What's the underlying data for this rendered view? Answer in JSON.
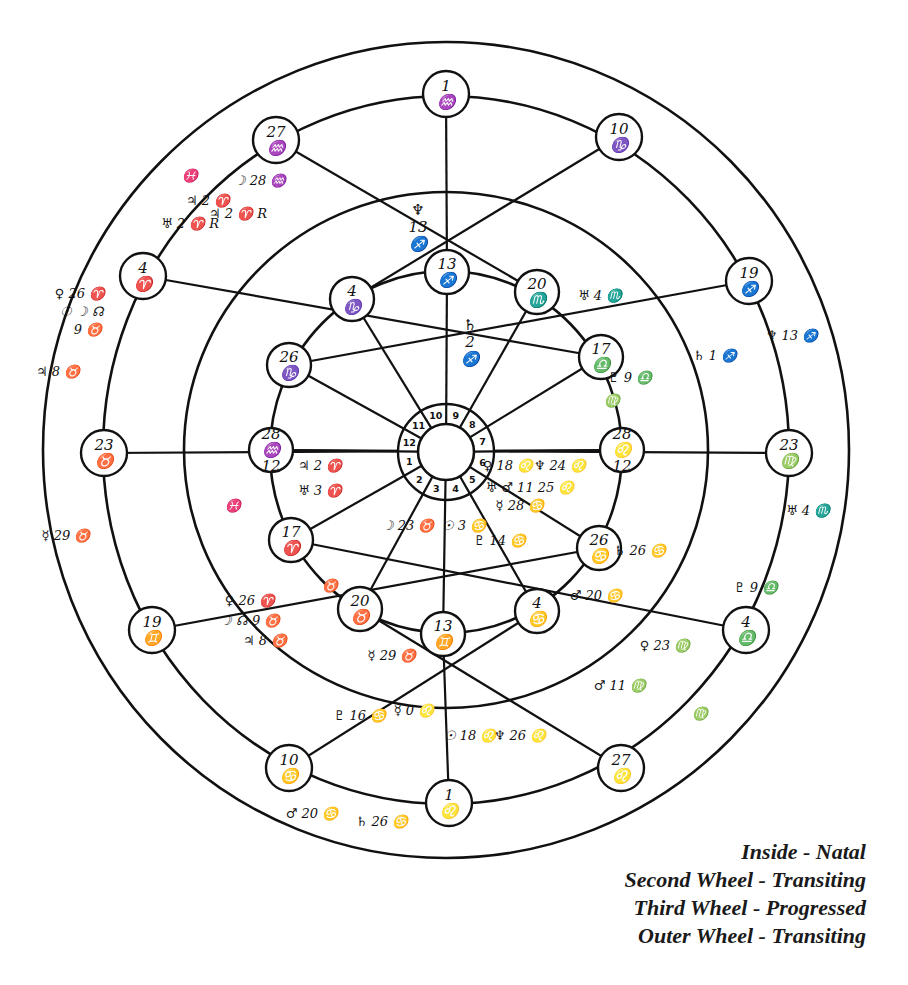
{
  "figure": {
    "type": "astrological tri-wheel chart (hand-drawn)",
    "legend": [
      {
        "ring": "inside",
        "label": "Inside - Natal"
      },
      {
        "ring": "second",
        "label": "Second Wheel - Transiting"
      },
      {
        "ring": "third",
        "label": "Third Wheel - Progressed"
      },
      {
        "ring": "outer",
        "label": "Outer Wheel - Transiting"
      }
    ],
    "house_numbers": [
      "1",
      "2",
      "3",
      "4",
      "5",
      "6",
      "7",
      "8",
      "9",
      "10",
      "11",
      "12"
    ],
    "inner_cusps": [
      {
        "house": "10",
        "text": "13 ♐",
        "x": 447,
        "y": 272
      },
      {
        "house": "11",
        "text": "4 ♑",
        "x": 352,
        "y": 299
      },
      {
        "house": "12",
        "text": "26 ♑",
        "x": 289,
        "y": 365
      },
      {
        "house": "1",
        "text": "28 ♒ 12",
        "x": 271,
        "y": 450
      },
      {
        "house": "2",
        "text": "17 ♈",
        "x": 291,
        "y": 540
      },
      {
        "house": "3",
        "text": "20 ♉",
        "x": 360,
        "y": 609
      },
      {
        "house": "4",
        "text": "13 ♊",
        "x": 443,
        "y": 634
      },
      {
        "house": "5",
        "text": "4 ♋",
        "x": 537,
        "y": 611
      },
      {
        "house": "6",
        "text": "26 ♋",
        "x": 599,
        "y": 548
      },
      {
        "house": "7",
        "text": "28 ♌ 12",
        "x": 622,
        "y": 450
      },
      {
        "house": "8",
        "text": "17 ♎",
        "x": 601,
        "y": 357
      },
      {
        "house": "9",
        "text": "20 ♏",
        "x": 537,
        "y": 292
      }
    ],
    "outer_cusps": [
      {
        "text": "1 ♒",
        "x": 446,
        "y": 94
      },
      {
        "text": "10 ♑",
        "x": 619,
        "y": 137
      },
      {
        "text": "19 ♐",
        "x": 749,
        "y": 281
      },
      {
        "text": "23 ♍",
        "x": 789,
        "y": 453
      },
      {
        "text": "4 ♎",
        "x": 746,
        "y": 630
      },
      {
        "text": "27 ♌",
        "x": 621,
        "y": 768
      },
      {
        "text": "1 ♌",
        "x": 449,
        "y": 803
      },
      {
        "text": "10 ♋",
        "x": 289,
        "y": 768
      },
      {
        "text": "19 ♊",
        "x": 152,
        "y": 630
      },
      {
        "text": "23 ♉",
        "x": 104,
        "y": 453
      },
      {
        "text": "4 ♈",
        "x": 143,
        "y": 276
      },
      {
        "text": "27 ♒",
        "x": 276,
        "y": 140
      }
    ],
    "natal_planets": [
      {
        "label": "♄ 2 ♐",
        "x": 470,
        "y": 330,
        "vertical": true
      },
      {
        "label": "♀ 18 ♌",
        "x": 508,
        "y": 470
      },
      {
        "label": "♆ 24 ♌",
        "x": 560,
        "y": 470
      },
      {
        "label": "♅ ♂ 11 25 ♌",
        "x": 530,
        "y": 492
      },
      {
        "label": "☿ 28 ♋",
        "x": 520,
        "y": 510
      },
      {
        "label": "♇ 14 ♋",
        "x": 500,
        "y": 545
      },
      {
        "label": "☉ 3 ♋",
        "x": 464,
        "y": 530
      },
      {
        "label": "☽ 23 ♉",
        "x": 408,
        "y": 530
      },
      {
        "label": "♃ 2 ♈",
        "x": 320,
        "y": 470
      },
      {
        "label": "♅ 3 ♈",
        "x": 320,
        "y": 495
      }
    ],
    "transit_inner_planets": [
      {
        "label": "♅ 4 ♏",
        "x": 600,
        "y": 300
      },
      {
        "label": "♇ 9 ♎",
        "x": 630,
        "y": 382
      },
      {
        "label": "♍",
        "x": 612,
        "y": 405
      },
      {
        "label": "♄ 26 ♋",
        "x": 640,
        "y": 555
      },
      {
        "label": "♂ 20 ♋",
        "x": 596,
        "y": 600
      },
      {
        "label": "☿ 29 ♉",
        "x": 392,
        "y": 660
      },
      {
        "label": "♀ 26 ♈",
        "x": 250,
        "y": 605
      },
      {
        "label": "☽ ☊ 9 ♉",
        "x": 250,
        "y": 625
      },
      {
        "label": "♃ 8 ♉",
        "x": 265,
        "y": 645
      },
      {
        "label": "♉",
        "x": 330,
        "y": 590
      },
      {
        "label": "♓",
        "x": 233,
        "y": 510
      },
      {
        "label": "♆ 13 ♐",
        "x": 418,
        "y": 215,
        "vertical": true
      }
    ],
    "progressed_planets": [
      {
        "label": "♄ 1 ♐",
        "x": 715,
        "y": 360
      },
      {
        "label": "♀ 23 ♍",
        "x": 665,
        "y": 650
      },
      {
        "label": "♂ 11 ♍",
        "x": 620,
        "y": 690
      },
      {
        "label": "♇ 16 ♋",
        "x": 360,
        "y": 720
      },
      {
        "label": "☿ 0 ♌",
        "x": 414,
        "y": 715
      },
      {
        "label": "☉ 18 ♌",
        "x": 470,
        "y": 740
      },
      {
        "label": "♆ 26 ♌",
        "x": 520,
        "y": 740
      },
      {
        "label": "♃ 2 ♈",
        "x": 208,
        "y": 205
      },
      {
        "label": "♅ 2 ♈ R",
        "x": 190,
        "y": 228
      },
      {
        "label": "☽ 28 ♒",
        "x": 260,
        "y": 185
      },
      {
        "label": "♃ 2 ♈ R",
        "x": 238,
        "y": 218
      },
      {
        "label": "♓",
        "x": 190,
        "y": 180
      }
    ],
    "outer_transit_planets": [
      {
        "label": "♆ 13 ♐",
        "x": 792,
        "y": 340
      },
      {
        "label": "♅ 4 ♏",
        "x": 808,
        "y": 515
      },
      {
        "label": "♇ 9 ♎",
        "x": 756,
        "y": 592
      },
      {
        "label": "♍",
        "x": 700,
        "y": 718
      },
      {
        "label": "♂ 20 ♋",
        "x": 312,
        "y": 818
      },
      {
        "label": "♄ 26 ♋",
        "x": 382,
        "y": 826
      },
      {
        "label": "☿ 29 ♉",
        "x": 66,
        "y": 540
      },
      {
        "label": "♀ 26 ♈",
        "x": 80,
        "y": 298
      },
      {
        "label": "☉ ☽ ☊",
        "x": 82,
        "y": 316
      },
      {
        "label": "9 ♉",
        "x": 88,
        "y": 334
      },
      {
        "label": "♃ 8 ♉",
        "x": 58,
        "y": 376
      }
    ]
  }
}
